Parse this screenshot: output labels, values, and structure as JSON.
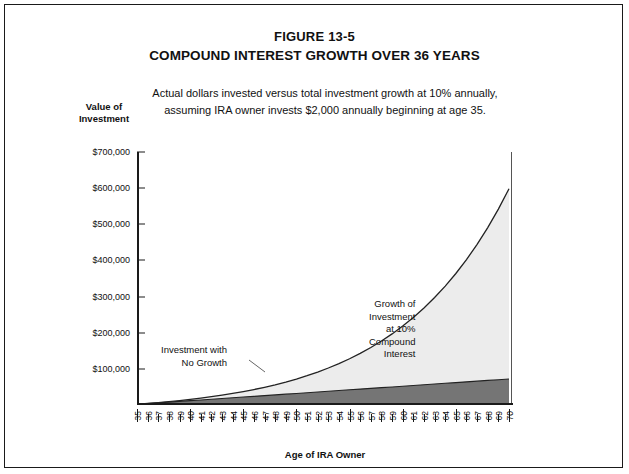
{
  "figure": {
    "number": "FIGURE 13-5",
    "title": "COMPOUND INTEREST GROWTH OVER 36 YEARS",
    "lead_line1": "Actual dollars invested versus total investment growth at 10% annually,",
    "lead_line2": "assuming IRA owner invests $2,000 annually beginning at age 35."
  },
  "axes": {
    "y_label_line1": "Value of",
    "y_label_line2": "Investment",
    "x_title": "Age of IRA Owner"
  },
  "annotations": {
    "left_line1": "Investment with",
    "left_line2": "No Growth",
    "right_line1": "Growth of",
    "right_line2": "Investment",
    "right_line3": "at 10%",
    "right_line4": "Compound",
    "right_line5": "Interest"
  },
  "colors": {
    "border": "#1a1a1a",
    "growth_fill": "#ececec",
    "principal_fill": "#757575",
    "curve_line": "#222222",
    "background": "#ffffff"
  },
  "chart_data": {
    "type": "area",
    "title": "COMPOUND INTEREST GROWTH OVER 36 YEARS",
    "subtitle": "Actual dollars invested versus total investment growth at 10% annually, assuming IRA owner invests $2,000 annually beginning at age 35.",
    "xlabel": "Age of IRA Owner",
    "ylabel": "Value of Investment",
    "xlim": [
      35,
      70
    ],
    "ylim": [
      0,
      700000
    ],
    "ytick_labels": [
      "$100,000",
      "$200,000",
      "$300,000",
      "$400,000",
      "$500,000",
      "$600,000",
      "$700,000"
    ],
    "ytick_values": [
      100000,
      200000,
      300000,
      400000,
      500000,
      600000,
      700000
    ],
    "grid": false,
    "legend": "annotations",
    "annual_contribution": 2000,
    "annual_rate_percent": 10,
    "years": 36,
    "x": [
      35,
      36,
      37,
      38,
      39,
      40,
      41,
      42,
      43,
      44,
      45,
      46,
      47,
      48,
      49,
      50,
      51,
      52,
      53,
      54,
      55,
      56,
      57,
      58,
      59,
      60,
      61,
      62,
      63,
      64,
      65,
      66,
      67,
      68,
      69,
      70
    ],
    "series": [
      {
        "name": "Growth of Investment at 10% Compound Interest",
        "fill": "#ececec",
        "values": [
          2000,
          4200,
          6620,
          9282,
          12210,
          15431,
          18974,
          22872,
          27159,
          31875,
          37062,
          42768,
          49045,
          55950,
          63545,
          71899,
          81089,
          91198,
          102318,
          114550,
          128005,
          142805,
          159086,
          176995,
          196694,
          218363,
          242200,
          268420,
          297262,
          328988,
          363887,
          402276,
          444503,
          490953,
          542049,
          598254
        ]
      },
      {
        "name": "Investment with No Growth",
        "fill": "#757575",
        "values": [
          2000,
          4000,
          6000,
          8000,
          10000,
          12000,
          14000,
          16000,
          18000,
          20000,
          22000,
          24000,
          26000,
          28000,
          30000,
          32000,
          34000,
          36000,
          38000,
          40000,
          42000,
          44000,
          46000,
          48000,
          50000,
          52000,
          54000,
          56000,
          58000,
          60000,
          62000,
          64000,
          66000,
          68000,
          70000,
          72000
        ]
      }
    ]
  }
}
